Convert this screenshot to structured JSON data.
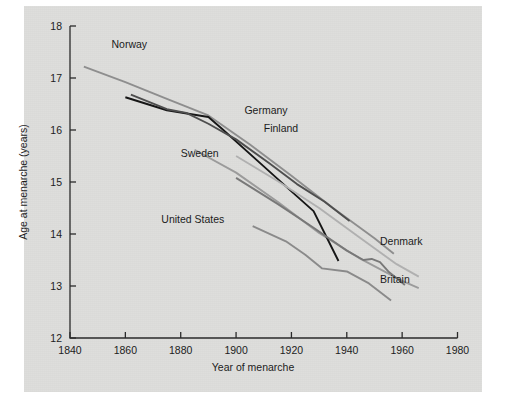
{
  "figure": {
    "background_color": "#dededc",
    "page_color": "#ffffff"
  },
  "chart_data": {
    "type": "line",
    "title": "",
    "xlabel": "Year of menarche",
    "ylabel": "Age at menarche (years)",
    "xlim": [
      1840,
      1980
    ],
    "ylim": [
      12,
      18
    ],
    "xticks": [
      1840,
      1860,
      1880,
      1900,
      1920,
      1940,
      1960,
      1980
    ],
    "xticklabels": [
      "1840",
      "1860",
      "1880",
      "1900",
      "1920",
      "1940",
      "1960",
      "1980"
    ],
    "yticks": [
      12,
      13,
      14,
      15,
      16,
      17,
      18
    ],
    "yticklabels": [
      "12",
      "13",
      "14",
      "15",
      "16",
      "17",
      "18"
    ],
    "grid": false,
    "legend": "inline-labels",
    "series": [
      {
        "name": "Norway",
        "color": "#8e8e8e",
        "width": 1.9,
        "label_x": 1855,
        "label_y": 17.58,
        "points": [
          [
            1845,
            17.22
          ],
          [
            1860,
            16.92
          ],
          [
            1875,
            16.6
          ],
          [
            1890,
            16.28
          ],
          [
            1905,
            15.72
          ],
          [
            1920,
            15.12
          ],
          [
            1935,
            14.5
          ],
          [
            1950,
            13.92
          ],
          [
            1957,
            13.62
          ]
        ]
      },
      {
        "name": "Sweden",
        "color": "#9b9b9b",
        "width": 1.9,
        "label_x": 1880,
        "label_y": 15.48,
        "points": [
          [
            1885,
            15.62
          ],
          [
            1900,
            15.18
          ],
          [
            1915,
            14.62
          ],
          [
            1930,
            14.02
          ],
          [
            1945,
            13.52
          ],
          [
            1960,
            13.1
          ],
          [
            1966,
            12.96
          ]
        ]
      },
      {
        "name": "Germany",
        "color": "#161616",
        "width": 1.9,
        "label_x": 1903,
        "label_y": 16.3,
        "points": [
          [
            1860,
            16.63
          ],
          [
            1875,
            16.38
          ],
          [
            1890,
            16.25
          ],
          [
            1895,
            16.02
          ],
          [
            1910,
            15.3
          ],
          [
            1920,
            14.82
          ],
          [
            1928,
            14.44
          ],
          [
            1937,
            13.48
          ]
        ]
      },
      {
        "name": "Finland",
        "color": "#4e4e4e",
        "width": 1.9,
        "label_x": 1910,
        "label_y": 15.96,
        "points": [
          [
            1862,
            16.68
          ],
          [
            1875,
            16.4
          ],
          [
            1882,
            16.33
          ],
          [
            1890,
            16.12
          ],
          [
            1900,
            15.82
          ],
          [
            1912,
            15.36
          ],
          [
            1922,
            14.96
          ],
          [
            1932,
            14.62
          ],
          [
            1941,
            14.25
          ]
        ]
      },
      {
        "name": "United States",
        "color": "#8a8a8a",
        "width": 1.9,
        "label_x": 1873,
        "label_y": 14.22,
        "points": [
          [
            1906,
            14.15
          ],
          [
            1918,
            13.86
          ],
          [
            1925,
            13.6
          ],
          [
            1931,
            13.34
          ],
          [
            1940,
            13.28
          ],
          [
            1948,
            13.05
          ],
          [
            1956,
            12.72
          ]
        ]
      },
      {
        "name": "Denmark",
        "color": "#b0b0b0",
        "width": 1.9,
        "label_x": 1952,
        "label_y": 13.78,
        "points": [
          [
            1900,
            15.5
          ],
          [
            1915,
            15.02
          ],
          [
            1930,
            14.5
          ],
          [
            1945,
            13.92
          ],
          [
            1958,
            13.42
          ],
          [
            1966,
            13.18
          ]
        ]
      },
      {
        "name": "Britain",
        "color": "#787878",
        "width": 1.9,
        "label_x": 1952,
        "label_y": 13.05,
        "points": [
          [
            1900,
            15.08
          ],
          [
            1915,
            14.58
          ],
          [
            1928,
            14.12
          ],
          [
            1940,
            13.68
          ],
          [
            1946,
            13.5
          ],
          [
            1949,
            13.52
          ],
          [
            1952,
            13.46
          ],
          [
            1955,
            13.28
          ],
          [
            1961,
            13.02
          ]
        ]
      }
    ]
  }
}
